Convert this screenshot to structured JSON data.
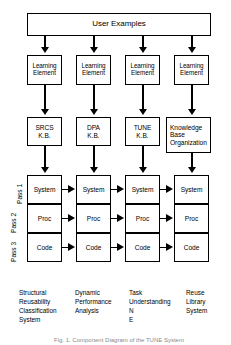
{
  "figure": {
    "title": "User Examples",
    "caption": "Fig. 1.  Component Diagram of the TUNE System",
    "top_box_label": "User Examples"
  },
  "pass_labels": [
    {
      "id": "pass-1",
      "label": "Pass 1"
    },
    {
      "id": "pass-2",
      "label": "Pass 2"
    },
    {
      "id": "pass-3",
      "label": "Pass 3"
    }
  ],
  "columns": [
    {
      "id": "srcs",
      "learning_element": "Learning\nElement",
      "kb": "SRCS\nK.B.",
      "stack": [
        "System",
        "Proc",
        "Code"
      ],
      "caption": "Structural\nReusability\nClassification\nSystem"
    },
    {
      "id": "dpa",
      "learning_element": "Learning\nElement",
      "kb": "DPA\nK.B.",
      "stack": [
        "System",
        "Proc",
        "Code"
      ],
      "caption": "Dynamic\nPerformance\nAnalysis"
    },
    {
      "id": "tune",
      "learning_element": "Learning\nElement",
      "kb": "TUNE\nK.B.",
      "stack": [
        "System",
        "Proc",
        "Code"
      ],
      "caption": "Task\nUnderstanding\nN\nE"
    },
    {
      "id": "reuse",
      "learning_element": "Learning\nElement",
      "kb": "Knowledge\nBase\nOrganization",
      "stack": [
        "System",
        "Proc",
        "Code"
      ],
      "caption": "Reuse\nLibrary\nSystem"
    }
  ],
  "colors": {
    "line": "#000000",
    "background": "#ffffff",
    "caption_text": "#8a8a8a"
  }
}
